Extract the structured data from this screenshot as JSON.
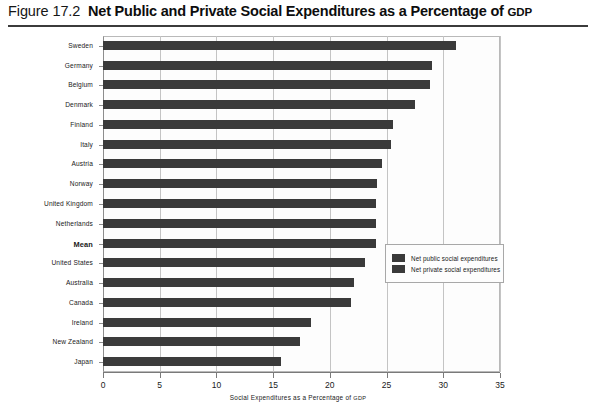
{
  "figure": {
    "number": "Figure 17.2",
    "title_main": "Net Public and Private Social Expenditures as a Percentage of ",
    "title_smallcaps": "GDP"
  },
  "axis": {
    "x_title_main": "Social Expenditures as a Percentage of ",
    "x_title_smallcaps": "GDP"
  },
  "legend": {
    "items": [
      {
        "label": "Net public social expenditures",
        "color": "#3a3a3a"
      },
      {
        "label": "Net private social expenditures",
        "color": "#3a3a3a"
      }
    ]
  },
  "chart_data": {
    "type": "bar",
    "orientation": "horizontal",
    "title": "Net Public and Private Social Expenditures as a Percentage of GDP",
    "xlabel": "Social Expenditures as a Percentage of GDP",
    "ylabel": "",
    "xlim": [
      0,
      35
    ],
    "xticks": [
      0,
      5,
      10,
      15,
      20,
      25,
      30,
      35
    ],
    "grid": true,
    "legend_position": "inside-right",
    "bar_color": "#3a3a3a",
    "categories": [
      "Sweden",
      "Germany",
      "Belgium",
      "Denmark",
      "Finland",
      "Italy",
      "Austria",
      "Norway",
      "United Kingdom",
      "Netherlands",
      "Mean",
      "United States",
      "Australia",
      "Canada",
      "Ireland",
      "New Zealand",
      "Japan"
    ],
    "values": [
      31.1,
      29.0,
      28.8,
      27.5,
      25.6,
      25.4,
      24.6,
      24.2,
      24.1,
      24.1,
      24.1,
      23.1,
      22.1,
      21.9,
      18.3,
      17.4,
      15.7
    ],
    "series": [
      {
        "name": "Net public social expenditures",
        "values": [
          31.1,
          29.0,
          28.8,
          27.5,
          25.6,
          25.4,
          24.6,
          24.2,
          24.1,
          24.1,
          24.1,
          23.1,
          22.1,
          21.9,
          18.3,
          17.4,
          15.7
        ]
      }
    ],
    "highlighted_category": "Mean"
  }
}
